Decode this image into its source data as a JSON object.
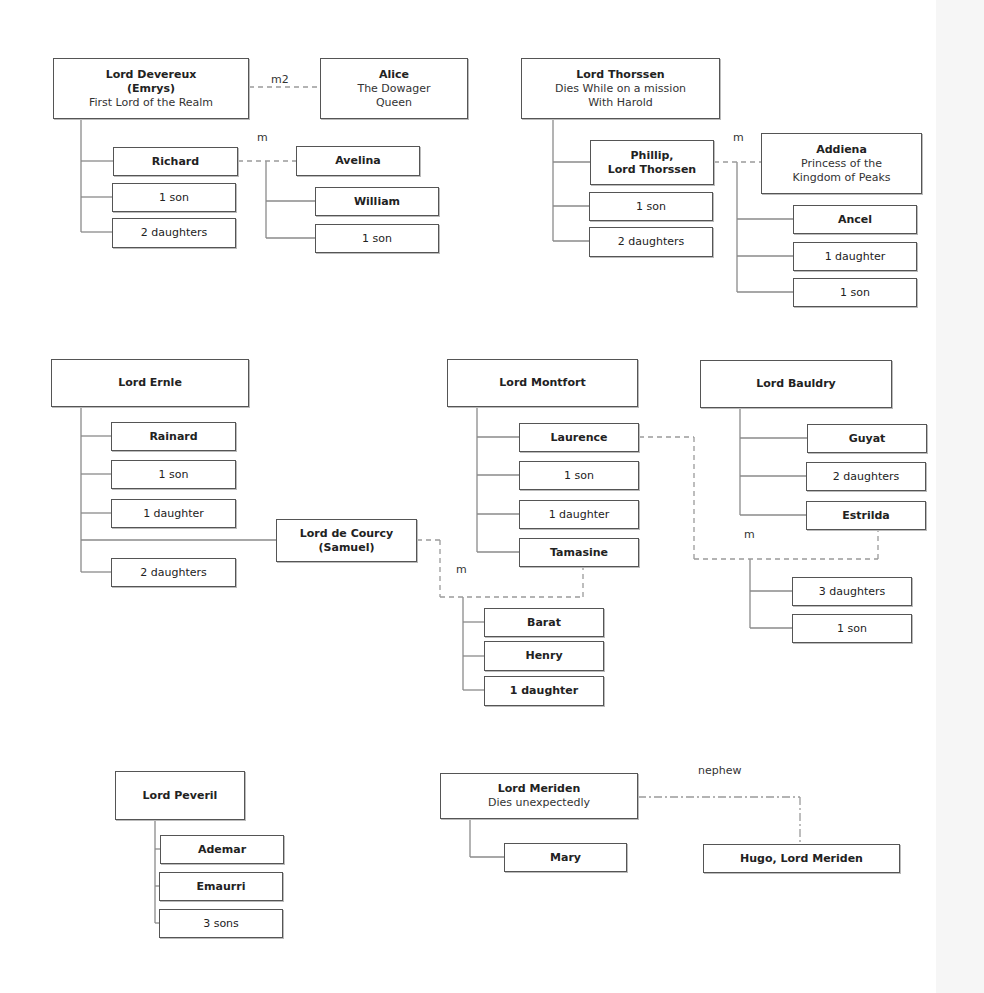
{
  "colors": {
    "line": "#8a8a8a",
    "dash": "#9a9a9a",
    "border": "#555555",
    "text": "#222222"
  },
  "nodes": [
    {
      "id": "devereux",
      "name": "Lord Devereux",
      "lines": [
        "(Emrys)"
      ],
      "desc": [
        "First Lord of the Realm"
      ],
      "x": 53,
      "y": 58,
      "w": 196,
      "h": 61,
      "bold": true
    },
    {
      "id": "alice",
      "name": "Alice",
      "desc": [
        "The Dowager",
        "Queen"
      ],
      "x": 320,
      "y": 58,
      "w": 148,
      "h": 61,
      "bold": true
    },
    {
      "id": "richard",
      "name": "Richard",
      "x": 113,
      "y": 147,
      "w": 125,
      "h": 29,
      "bold": true
    },
    {
      "id": "devereux-1son",
      "name": "1 son",
      "x": 112,
      "y": 183,
      "w": 124,
      "h": 29,
      "bold": false
    },
    {
      "id": "devereux-2daughters",
      "name": "2 daughters",
      "x": 112,
      "y": 218,
      "w": 124,
      "h": 30,
      "bold": false
    },
    {
      "id": "avelina",
      "name": "Avelina",
      "x": 296,
      "y": 146,
      "w": 124,
      "h": 30,
      "bold": true
    },
    {
      "id": "william",
      "name": "William",
      "x": 315,
      "y": 187,
      "w": 124,
      "h": 29,
      "bold": true
    },
    {
      "id": "avelina-1son",
      "name": "1 son",
      "x": 315,
      "y": 224,
      "w": 124,
      "h": 29,
      "bold": false
    },
    {
      "id": "thorssen",
      "name": "Lord Thorssen",
      "desc": [
        "Dies While on a mission",
        "With Harold"
      ],
      "x": 521,
      "y": 58,
      "w": 199,
      "h": 61,
      "bold": true
    },
    {
      "id": "phillip",
      "name": "Phillip,",
      "lines": [
        "Lord Thorssen"
      ],
      "x": 590,
      "y": 140,
      "w": 124,
      "h": 45,
      "bold": true
    },
    {
      "id": "thorssen-1son",
      "name": "1 son",
      "x": 589,
      "y": 192,
      "w": 124,
      "h": 29,
      "bold": false
    },
    {
      "id": "thorssen-2daughters",
      "name": "2 daughters",
      "x": 589,
      "y": 227,
      "w": 124,
      "h": 30,
      "bold": false
    },
    {
      "id": "addiena",
      "name": "Addiena",
      "desc": [
        "Princess of the",
        "Kingdom of Peaks"
      ],
      "x": 761,
      "y": 133,
      "w": 161,
      "h": 61,
      "bold": true
    },
    {
      "id": "ancel",
      "name": "Ancel",
      "x": 793,
      "y": 205,
      "w": 124,
      "h": 29,
      "bold": true
    },
    {
      "id": "addiena-1daughter",
      "name": "1 daughter",
      "x": 793,
      "y": 242,
      "w": 124,
      "h": 29,
      "bold": false
    },
    {
      "id": "addiena-1son",
      "name": "1 son",
      "x": 793,
      "y": 278,
      "w": 124,
      "h": 29,
      "bold": false
    },
    {
      "id": "ernle",
      "name": "Lord Ernle",
      "x": 51,
      "y": 359,
      "w": 198,
      "h": 48,
      "bold": true
    },
    {
      "id": "rainard",
      "name": "Rainard",
      "x": 111,
      "y": 422,
      "w": 125,
      "h": 29,
      "bold": true
    },
    {
      "id": "ernle-1son",
      "name": "1 son",
      "x": 111,
      "y": 460,
      "w": 125,
      "h": 29,
      "bold": false
    },
    {
      "id": "ernle-1daughter",
      "name": "1 daughter",
      "x": 111,
      "y": 499,
      "w": 125,
      "h": 29,
      "bold": false
    },
    {
      "id": "decourcy",
      "name": "Lord de Courcy",
      "lines": [
        "(Samuel)"
      ],
      "x": 276,
      "y": 519,
      "w": 141,
      "h": 43,
      "bold": true
    },
    {
      "id": "ernle-2daughters",
      "name": "2 daughters",
      "x": 111,
      "y": 558,
      "w": 125,
      "h": 29,
      "bold": false
    },
    {
      "id": "montfort",
      "name": "Lord Montfort",
      "x": 447,
      "y": 359,
      "w": 191,
      "h": 48,
      "bold": true
    },
    {
      "id": "laurence",
      "name": "Laurence",
      "x": 519,
      "y": 423,
      "w": 120,
      "h": 29,
      "bold": true
    },
    {
      "id": "montfort-1son",
      "name": "1 son",
      "x": 519,
      "y": 461,
      "w": 120,
      "h": 29,
      "bold": false
    },
    {
      "id": "montfort-1daughter",
      "name": "1 daughter",
      "x": 519,
      "y": 500,
      "w": 120,
      "h": 29,
      "bold": false
    },
    {
      "id": "tamasine",
      "name": "Tamasine",
      "x": 519,
      "y": 538,
      "w": 120,
      "h": 29,
      "bold": true
    },
    {
      "id": "barat",
      "name": "Barat",
      "x": 484,
      "y": 608,
      "w": 120,
      "h": 29,
      "bold": true
    },
    {
      "id": "henry",
      "name": "Henry",
      "x": 484,
      "y": 641,
      "w": 120,
      "h": 30,
      "bold": true
    },
    {
      "id": "tamasine-1daughter",
      "name": "1 daughter",
      "x": 484,
      "y": 676,
      "w": 120,
      "h": 30,
      "bold": true
    },
    {
      "id": "bauldry",
      "name": "Lord Bauldry",
      "x": 700,
      "y": 360,
      "w": 192,
      "h": 48,
      "bold": true
    },
    {
      "id": "guyat",
      "name": "Guyat",
      "x": 807,
      "y": 424,
      "w": 120,
      "h": 29,
      "bold": true
    },
    {
      "id": "bauldry-2daughters",
      "name": "2 daughters",
      "x": 806,
      "y": 462,
      "w": 120,
      "h": 29,
      "bold": false
    },
    {
      "id": "estrilda",
      "name": "Estrilda",
      "x": 806,
      "y": 501,
      "w": 120,
      "h": 29,
      "bold": true
    },
    {
      "id": "estrilda-3daughters",
      "name": "3 daughters",
      "x": 792,
      "y": 577,
      "w": 120,
      "h": 29,
      "bold": false
    },
    {
      "id": "estrilda-1son",
      "name": "1 son",
      "x": 792,
      "y": 614,
      "w": 120,
      "h": 29,
      "bold": false
    },
    {
      "id": "peveril",
      "name": "Lord Peveril",
      "x": 115,
      "y": 771,
      "w": 130,
      "h": 49,
      "bold": true
    },
    {
      "id": "ademar",
      "name": "Ademar",
      "x": 160,
      "y": 835,
      "w": 124,
      "h": 29,
      "bold": true
    },
    {
      "id": "emaurri",
      "name": "Emaurri",
      "x": 159,
      "y": 872,
      "w": 124,
      "h": 29,
      "bold": true
    },
    {
      "id": "peveril-3sons",
      "name": "3 sons",
      "x": 159,
      "y": 909,
      "w": 124,
      "h": 29,
      "bold": false
    },
    {
      "id": "meriden",
      "name": "Lord Meriden",
      "desc": [
        "Dies unexpectedly"
      ],
      "x": 440,
      "y": 773,
      "w": 198,
      "h": 46,
      "bold": true
    },
    {
      "id": "mary",
      "name": "Mary",
      "x": 504,
      "y": 843,
      "w": 123,
      "h": 29,
      "bold": true
    },
    {
      "id": "hugo",
      "name": "Hugo, Lord Meriden",
      "x": 703,
      "y": 844,
      "w": 197,
      "h": 29,
      "bold": true
    }
  ],
  "labels": [
    {
      "id": "m2-devereux-alice",
      "text": "m2",
      "x": 271,
      "y": 85
    },
    {
      "id": "m-richard-avelina",
      "text": "m",
      "x": 257,
      "y": 143
    },
    {
      "id": "m-phillip-addiena",
      "text": "m",
      "x": 733,
      "y": 143
    },
    {
      "id": "m-decourcy-tamasine",
      "text": "m",
      "x": 456,
      "y": 575
    },
    {
      "id": "m-laurence-estrilda",
      "text": "m",
      "x": 744,
      "y": 540
    },
    {
      "id": "nephew-meriden-hugo",
      "text": "nephew",
      "x": 698,
      "y": 776
    }
  ],
  "solid_lines": [
    [
      81,
      119,
      81,
      232
    ],
    [
      81,
      161,
      113,
      161
    ],
    [
      81,
      197,
      112,
      197
    ],
    [
      81,
      232,
      112,
      232
    ],
    [
      266,
      161,
      266,
      238
    ],
    [
      266,
      201,
      315,
      201
    ],
    [
      266,
      238,
      315,
      238
    ],
    [
      553,
      119,
      553,
      241
    ],
    [
      553,
      162,
      590,
      162
    ],
    [
      553,
      206,
      589,
      206
    ],
    [
      553,
      241,
      589,
      241
    ],
    [
      737,
      162,
      737,
      292
    ],
    [
      737,
      219,
      793,
      219
    ],
    [
      737,
      256,
      793,
      256
    ],
    [
      737,
      292,
      793,
      292
    ],
    [
      81,
      407,
      81,
      572
    ],
    [
      81,
      436,
      111,
      436
    ],
    [
      81,
      474,
      111,
      474
    ],
    [
      81,
      513,
      111,
      513
    ],
    [
      81,
      540,
      276,
      540
    ],
    [
      81,
      572,
      111,
      572
    ],
    [
      477,
      407,
      477,
      552
    ],
    [
      477,
      437,
      519,
      437
    ],
    [
      477,
      475,
      519,
      475
    ],
    [
      477,
      514,
      519,
      514
    ],
    [
      477,
      552,
      519,
      552
    ],
    [
      463,
      597,
      463,
      690
    ],
    [
      463,
      622,
      484,
      622
    ],
    [
      463,
      656,
      484,
      656
    ],
    [
      463,
      690,
      484,
      690
    ],
    [
      740,
      408,
      740,
      515
    ],
    [
      740,
      438,
      807,
      438
    ],
    [
      740,
      476,
      806,
      476
    ],
    [
      740,
      515,
      806,
      515
    ],
    [
      750,
      559,
      750,
      628
    ],
    [
      750,
      591,
      792,
      591
    ],
    [
      750,
      628,
      792,
      628
    ],
    [
      155,
      820,
      155,
      923
    ],
    [
      155,
      849,
      160,
      849
    ],
    [
      155,
      886,
      159,
      886
    ],
    [
      155,
      923,
      159,
      923
    ],
    [
      470,
      819,
      470,
      857
    ],
    [
      470,
      857,
      504,
      857
    ]
  ],
  "dashed_lines": [
    [
      249,
      87,
      320,
      87
    ],
    [
      238,
      161,
      296,
      161
    ],
    [
      714,
      162,
      761,
      162
    ],
    [
      417,
      540,
      440,
      540
    ],
    [
      440,
      540,
      440,
      597
    ],
    [
      440,
      597,
      583,
      597
    ],
    [
      583,
      597,
      583,
      567
    ],
    [
      639,
      437,
      694,
      437
    ],
    [
      694,
      437,
      694,
      559
    ],
    [
      694,
      559,
      878,
      559
    ],
    [
      878,
      559,
      878,
      530
    ]
  ],
  "dashdot_lines": [
    [
      638,
      797,
      800,
      797
    ],
    [
      800,
      797,
      800,
      844
    ]
  ]
}
